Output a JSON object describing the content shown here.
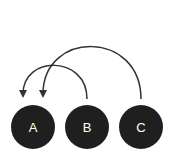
{
  "diagram": {
    "type": "arc-diagram",
    "colors": {
      "node": "#1f1f1f",
      "label": "#ffffff",
      "arrow": "#333333",
      "background": "#ffffff"
    },
    "nodes": [
      {
        "id": "A",
        "label": "A"
      },
      {
        "id": "B",
        "label": "B"
      },
      {
        "id": "C",
        "label": "C"
      }
    ],
    "edges": [
      {
        "from": "B",
        "to": "A"
      },
      {
        "from": "C",
        "to": "A"
      }
    ]
  }
}
